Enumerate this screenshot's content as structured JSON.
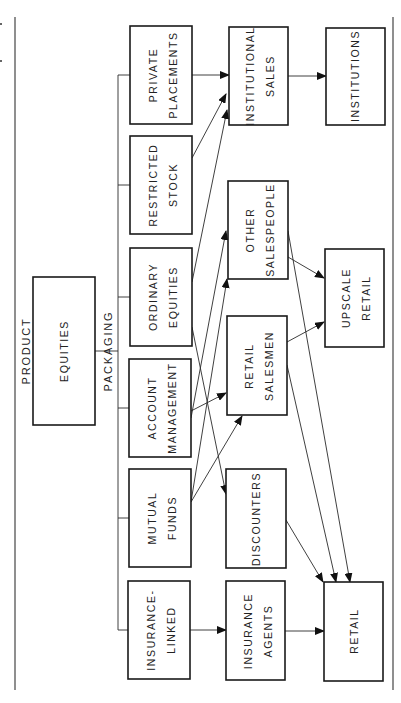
{
  "diagram": {
    "orientation": "rotated-90-ccw",
    "labels": {
      "product": "PRODUCT",
      "packaging": "PACKAGING"
    },
    "product": {
      "line1": "EQUITIES"
    },
    "packaging_items": [
      {
        "line1": "PRIVATE",
        "line2": "PLACEMENTS"
      },
      {
        "line1": "RESTRICTED",
        "line2": "STOCK"
      },
      {
        "line1": "ORDINARY",
        "line2": "EQUITIES"
      },
      {
        "line1": "ACCOUNT",
        "line2": "MANAGEMENT"
      },
      {
        "line1": "MUTUAL",
        "line2": "FUNDS"
      },
      {
        "line1": "INSURANCE-",
        "line2": "LINKED"
      }
    ],
    "channels": [
      {
        "line1": "INSTITUTIONAL",
        "line2": "SALES"
      },
      {
        "line1": "OTHER",
        "line2": "SALESPEOPLE"
      },
      {
        "line1": "RETAIL",
        "line2": "SALESMEN"
      },
      {
        "line1": "DISCOUNTERS"
      },
      {
        "line1": "INSURANCE",
        "line2": "AGENTS"
      }
    ],
    "markets": [
      {
        "line1": "INSTITUTIONS"
      },
      {
        "line1": "UPSCALE",
        "line2": "RETAIL"
      },
      {
        "line1": "RETAIL"
      }
    ],
    "edges": [
      [
        "PRIVATE PLACEMENTS",
        "INSTITUTIONAL SALES"
      ],
      [
        "RESTRICTED STOCK",
        "INSTITUTIONAL SALES"
      ],
      [
        "ORDINARY EQUITIES",
        "INSTITUTIONAL SALES"
      ],
      [
        "ORDINARY EQUITIES",
        "DISCOUNTERS"
      ],
      [
        "ACCOUNT MANAGEMENT",
        "OTHER SALESPEOPLE"
      ],
      [
        "ACCOUNT MANAGEMENT",
        "RETAIL SALESMEN"
      ],
      [
        "MUTUAL FUNDS",
        "OTHER SALESPEOPLE"
      ],
      [
        "MUTUAL FUNDS",
        "RETAIL SALESMEN"
      ],
      [
        "INSURANCE-LINKED",
        "INSURANCE AGENTS"
      ],
      [
        "INSTITUTIONAL SALES",
        "INSTITUTIONS"
      ],
      [
        "OTHER SALESPEOPLE",
        "UPSCALE RETAIL"
      ],
      [
        "OTHER SALESPEOPLE",
        "RETAIL"
      ],
      [
        "RETAIL SALESMEN",
        "UPSCALE RETAIL"
      ],
      [
        "RETAIL SALESMEN",
        "RETAIL"
      ],
      [
        "DISCOUNTERS",
        "RETAIL"
      ],
      [
        "INSURANCE AGENTS",
        "RETAIL"
      ]
    ]
  }
}
